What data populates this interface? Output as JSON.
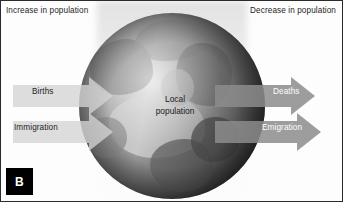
{
  "figure": {
    "panel_label": "B",
    "headers": {
      "left": "Increase in population",
      "right": "Decrease in population"
    },
    "center": {
      "line1": "Local",
      "line2": "population"
    },
    "inflows": [
      {
        "label": "Births",
        "direction": "in"
      },
      {
        "label": "Immigration",
        "direction": "in"
      }
    ],
    "outflows": [
      {
        "label": "Deaths",
        "direction": "out"
      },
      {
        "label": "Emigration",
        "direction": "out"
      }
    ],
    "colors": {
      "background": "#fdfdfd",
      "border": "#2b2b2b",
      "inflow_arrow": "#d3d3d3",
      "outflow_arrow": "#8c8c8c",
      "badge_background": "#000000",
      "badge_text": "#ffffff",
      "text_dark": "#1d1d1d",
      "text_light": "#ffffff"
    }
  }
}
